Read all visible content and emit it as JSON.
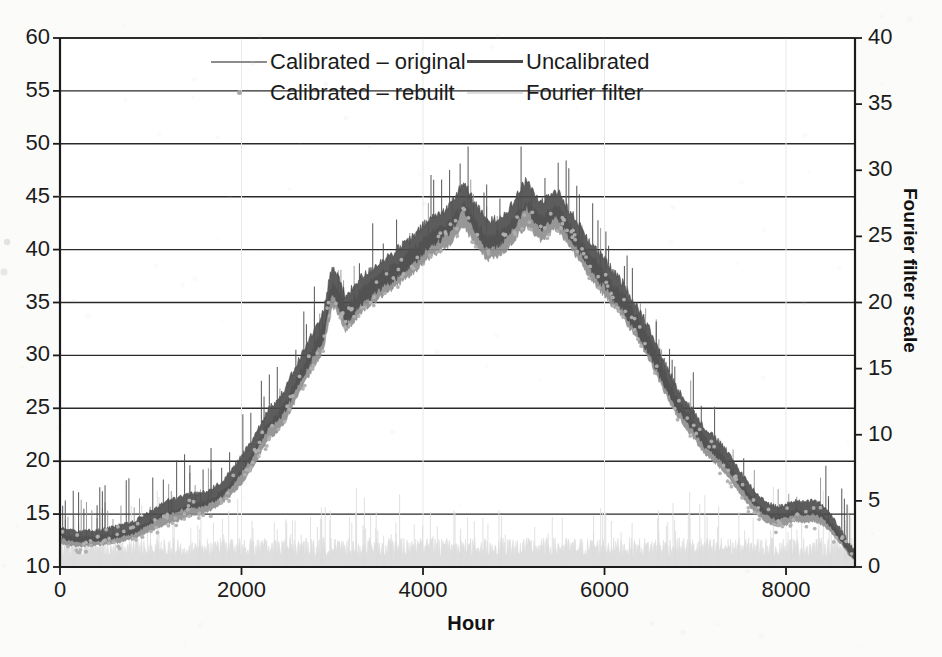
{
  "chart_data": {
    "type": "line",
    "title": "",
    "xlabel": "Hour",
    "ylabel": "",
    "y2label": "Fourier filter scale",
    "xlim": [
      0,
      8760
    ],
    "ylim": [
      10,
      60
    ],
    "y2lim": [
      0,
      40
    ],
    "xticks": [
      0,
      2000,
      4000,
      6000,
      8000
    ],
    "xtick_labels": [
      "0",
      "2000",
      "4000",
      "6000",
      "8000"
    ],
    "yticks": [
      10,
      15,
      20,
      25,
      30,
      35,
      40,
      45,
      50,
      55,
      60
    ],
    "ytick_labels": [
      "10",
      "15",
      "20",
      "25",
      "30",
      "35",
      "40",
      "45",
      "50",
      "55",
      "60"
    ],
    "y2ticks": [
      0,
      5,
      10,
      15,
      20,
      25,
      30,
      35,
      40
    ],
    "y2tick_labels": [
      "0",
      "5",
      "10",
      "15",
      "20",
      "25",
      "30",
      "35",
      "40"
    ],
    "grid": "horizontal",
    "legend_position": "top-center",
    "series": [
      {
        "name": "Calibrated – original",
        "axis": "left",
        "style": "line",
        "color": "#8c8c8c",
        "x": [
          0,
          200,
          400,
          600,
          800,
          1000,
          1100,
          1200,
          1300,
          1400,
          1500,
          1600,
          1700,
          1800,
          1900,
          2000,
          2100,
          2200,
          2300,
          2400,
          2500,
          2600,
          2700,
          2800,
          2900,
          2950,
          3000,
          3050,
          3100,
          3150,
          3200,
          3250,
          3300,
          3400,
          3500,
          3600,
          3700,
          3800,
          3900,
          4000,
          4100,
          4200,
          4300,
          4400,
          4450,
          4500,
          4600,
          4700,
          4800,
          4900,
          5000,
          5050,
          5100,
          5150,
          5200,
          5300,
          5400,
          5450,
          5500,
          5550,
          5600,
          5700,
          5800,
          5900,
          6000,
          6100,
          6200,
          6300,
          6400,
          6500,
          6600,
          6700,
          6800,
          6900,
          7000,
          7100,
          7200,
          7300,
          7400,
          7500,
          7600,
          7700,
          7800,
          7900,
          8000,
          8100,
          8200,
          8300,
          8400,
          8500,
          8600,
          8700,
          8760
        ],
        "values": [
          12.6,
          12.3,
          12.4,
          12.6,
          13.0,
          13.8,
          14.2,
          14.6,
          14.8,
          15.2,
          15.4,
          15.6,
          16.0,
          16.6,
          17.4,
          18.4,
          19.6,
          21.2,
          22.8,
          23.4,
          24.8,
          26.6,
          28.2,
          29.8,
          31.4,
          33.6,
          35.6,
          35.0,
          34.2,
          33.2,
          33.6,
          34.2,
          34.8,
          35.4,
          36.2,
          36.8,
          37.4,
          38.2,
          38.8,
          39.6,
          40.4,
          40.8,
          41.4,
          42.6,
          43.2,
          42.4,
          41.2,
          40.0,
          40.2,
          40.8,
          41.6,
          42.4,
          42.8,
          43.2,
          42.6,
          41.8,
          42.4,
          43.0,
          42.6,
          42.0,
          41.4,
          40.2,
          38.8,
          37.6,
          36.6,
          35.4,
          34.6,
          33.2,
          31.8,
          30.4,
          28.4,
          26.6,
          25.0,
          23.8,
          22.6,
          21.4,
          20.6,
          19.8,
          18.6,
          17.4,
          16.2,
          15.2,
          14.6,
          14.2,
          14.4,
          14.8,
          14.6,
          14.8,
          14.4,
          13.6,
          12.6,
          11.4,
          11.0
        ]
      },
      {
        "name": "Uncalibrated",
        "axis": "left",
        "style": "line",
        "color": "#4a4a4a",
        "x": [
          0,
          200,
          400,
          600,
          800,
          1000,
          1100,
          1200,
          1300,
          1400,
          1500,
          1600,
          1700,
          1800,
          1900,
          2000,
          2100,
          2200,
          2300,
          2400,
          2500,
          2600,
          2700,
          2800,
          2900,
          2950,
          3000,
          3050,
          3100,
          3150,
          3200,
          3250,
          3300,
          3400,
          3500,
          3600,
          3700,
          3800,
          3900,
          4000,
          4100,
          4200,
          4300,
          4400,
          4450,
          4500,
          4600,
          4700,
          4800,
          4900,
          5000,
          5050,
          5100,
          5150,
          5200,
          5300,
          5400,
          5450,
          5500,
          5550,
          5600,
          5700,
          5800,
          5900,
          6000,
          6100,
          6200,
          6300,
          6400,
          6500,
          6600,
          6700,
          6800,
          6900,
          7000,
          7100,
          7200,
          7300,
          7400,
          7500,
          7600,
          7700,
          7800,
          7900,
          8000,
          8100,
          8200,
          8300,
          8400,
          8500,
          8600,
          8700,
          8760
        ],
        "values": [
          13.2,
          12.8,
          12.9,
          13.2,
          13.6,
          14.6,
          15.2,
          15.6,
          15.8,
          16.2,
          16.2,
          16.4,
          16.8,
          17.4,
          18.4,
          19.6,
          20.8,
          22.4,
          24.0,
          24.6,
          26.0,
          27.8,
          29.4,
          31.0,
          32.6,
          35.0,
          37.0,
          36.2,
          35.2,
          34.0,
          34.6,
          35.2,
          35.8,
          36.4,
          37.2,
          37.8,
          38.4,
          39.2,
          39.8,
          40.8,
          41.6,
          42.0,
          42.8,
          44.2,
          45.0,
          44.0,
          42.6,
          41.2,
          41.4,
          42.0,
          43.0,
          44.0,
          44.6,
          45.2,
          44.2,
          43.0,
          43.8,
          44.4,
          43.8,
          43.2,
          42.4,
          41.2,
          39.8,
          38.6,
          37.6,
          36.4,
          35.4,
          34.0,
          32.6,
          31.2,
          29.2,
          27.4,
          25.8,
          24.6,
          23.4,
          22.2,
          21.4,
          20.6,
          19.4,
          18.2,
          17.0,
          16.0,
          15.4,
          15.0,
          15.2,
          15.6,
          15.4,
          15.6,
          15.2,
          14.2,
          13.0,
          11.6,
          11.1
        ]
      },
      {
        "name": "Calibrated – rebuilt",
        "axis": "left",
        "style": "marker",
        "color": "#b0b0b0"
      },
      {
        "name": "Fourier filter",
        "axis": "right",
        "style": "line",
        "color": "#dcdcdc",
        "baseline": 1.4,
        "noise_amplitude": 0.9,
        "spike_values": [
          4.6,
          4.2,
          5.0,
          4.4,
          3.8,
          4.8,
          4.2,
          3.6,
          4.4,
          5.2,
          4.0,
          3.4,
          4.6,
          4.0,
          3.2,
          4.2,
          3.8,
          4.4,
          3.6,
          4.0
        ]
      }
    ],
    "annotations": [
      "Dark uncalibrated trace rides approximately 0.8-1.6 units above the medium-gray calibrated trace throughout",
      "Sharp step increase near hour 3000 from 31 to 37, followed by a dip to 33",
      "Broad double-humped maximum between hours 4300 and 5600 peaking near 45",
      "Tail plateau near 15 between hours 7900 and 8400, then sharp decline to 11"
    ]
  },
  "axes": {
    "x_title": "Hour",
    "y2_title": "Fourier filter scale"
  },
  "legend": {
    "entries": [
      {
        "label": "Calibrated – original",
        "key": "line-swatch-gray",
        "color": "#8c8c8c",
        "style": "line"
      },
      {
        "label": "Uncalibrated",
        "key": "line-swatch-dark",
        "color": "#4a4a4a",
        "style": "line"
      },
      {
        "label": "Calibrated – rebuilt",
        "key": "dot-swatch-gray",
        "color": "#a8a8a8",
        "style": "dot"
      },
      {
        "label": "Fourier filter",
        "key": "line-swatch-light",
        "color": "#dcdcdc",
        "style": "line"
      }
    ]
  },
  "colors": {
    "background": "#fbfbf9",
    "axis": "#1b1b1b",
    "gridline": "#2a2a2a",
    "calibrated_original": "#8c8c8c",
    "uncalibrated": "#4a4a4a",
    "calibrated_rebuilt": "#b0b0b0",
    "fourier_filter": "#dcdcdc"
  }
}
